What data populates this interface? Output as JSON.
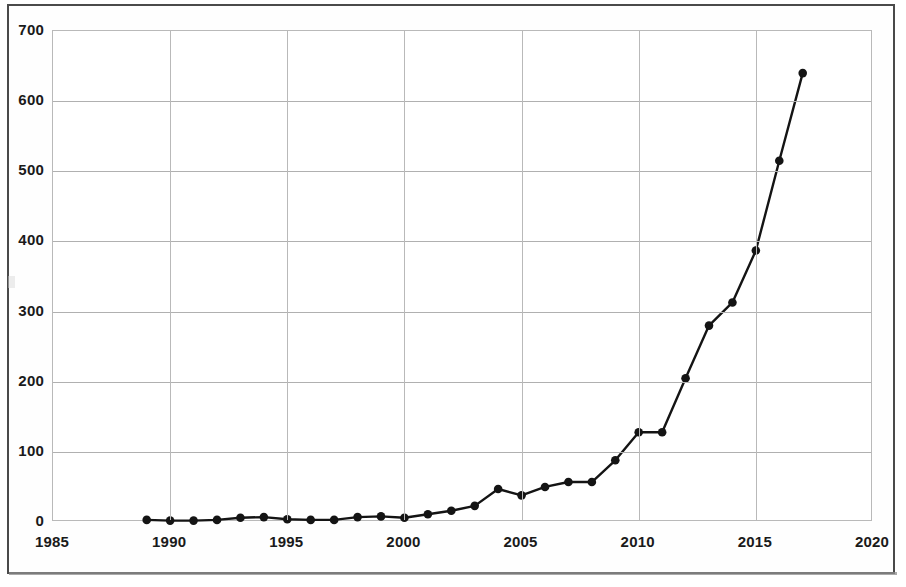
{
  "figure": {
    "kind": "scanned-line-chart",
    "frame_color": "#4a4a4a",
    "background_color": "#ffffff"
  },
  "chart_data": {
    "type": "line",
    "title": "",
    "subtitle": "",
    "xlabel": "",
    "ylabel": "",
    "xlim": [
      1985,
      2020
    ],
    "ylim": [
      0,
      700
    ],
    "xticks": [
      1985,
      1990,
      1995,
      2000,
      2005,
      2010,
      2015,
      2020
    ],
    "xtick_labels": [
      "1985",
      "1990",
      "1995",
      "2000",
      "2005",
      "2010",
      "2015",
      "2020"
    ],
    "yticks": [
      0,
      100,
      200,
      300,
      400,
      500,
      600,
      700
    ],
    "ytick_labels": [
      "0",
      "100",
      "200",
      "300",
      "400",
      "500",
      "600",
      "700"
    ],
    "grid": true,
    "grid_axis": "both",
    "legend": false,
    "legend_position": "none",
    "marker": "circle",
    "marker_color": "#141414",
    "line_color": "#141414",
    "line_width": 2.4,
    "series": [
      {
        "name": "",
        "x": [
          1989,
          1990,
          1991,
          1992,
          1993,
          1994,
          1995,
          1996,
          1997,
          1998,
          1999,
          2000,
          2001,
          2002,
          2003,
          2004,
          2005,
          2006,
          2007,
          2008,
          2009,
          2010,
          2011,
          2012,
          2013,
          2014,
          2015,
          2016,
          2017
        ],
        "values": [
          3,
          2,
          2,
          3,
          6,
          7,
          4,
          3,
          3,
          7,
          8,
          6,
          11,
          16,
          23,
          47,
          38,
          50,
          57,
          57,
          88,
          128,
          128,
          205,
          280,
          313,
          387,
          515,
          640
        ]
      }
    ]
  }
}
